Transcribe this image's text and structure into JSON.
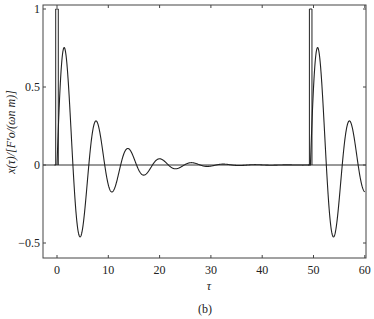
{
  "chart_data": {
    "type": "line",
    "title": "",
    "caption": "(b)",
    "xlabel": "τ",
    "ylabel": "x(τ)/[F′o/(ωn m)]",
    "xlim": [
      -2.7,
      60
    ],
    "ylim": [
      -0.6,
      1.02
    ],
    "xticks": [
      0,
      10,
      20,
      30,
      40,
      50,
      60
    ],
    "xtick_labels": [
      "0",
      "10",
      "20",
      "30",
      "40",
      "50",
      "60"
    ],
    "yticks": [
      -0.5,
      0,
      0.5,
      1
    ],
    "ytick_labels": [
      "−0.5",
      "0",
      "0.5",
      "1"
    ],
    "grid": false,
    "legend": null,
    "series": [
      {
        "name": "pulse input",
        "style": "thin rectangular pulses of height 1",
        "pulses": [
          {
            "start": -0.25,
            "end": 0.25,
            "height": 1
          },
          {
            "start": 49.2,
            "end": 49.7,
            "height": 1
          }
        ]
      },
      {
        "name": "response x(τ)",
        "model": {
          "amplitude": 0.95,
          "decay": 0.158,
          "omega": 1.013,
          "phase_shift": 0.0
        },
        "key_points": [
          {
            "x": 0,
            "y": 0
          },
          {
            "x": 1.5,
            "y": 0.8
          },
          {
            "x": 4.7,
            "y": -0.5
          },
          {
            "x": 7.7,
            "y": 0.31
          },
          {
            "x": 10.9,
            "y": -0.19
          },
          {
            "x": 14.0,
            "y": 0.12
          },
          {
            "x": 17.1,
            "y": -0.07
          },
          {
            "x": 20.3,
            "y": 0.04
          },
          {
            "x": 23.4,
            "y": -0.02
          },
          {
            "x": 30,
            "y": 0.0
          },
          {
            "x": 49.5,
            "y": 0
          },
          {
            "x": 50.9,
            "y": 0.8
          },
          {
            "x": 54.1,
            "y": -0.5
          },
          {
            "x": 57.2,
            "y": 0.31
          },
          {
            "x": 60,
            "y": -0.11
          }
        ],
        "restart_at": 49.4
      }
    ],
    "zero_line": true
  }
}
